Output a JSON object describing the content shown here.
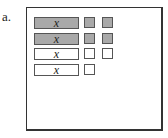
{
  "label": "a.",
  "colors": {
    "shaded": "#a9a9a9",
    "border": "#555555",
    "frame": "#333333"
  },
  "rows": [
    {
      "bar_text": "x",
      "shaded": true,
      "unit_squares": 2
    },
    {
      "bar_text": "x",
      "shaded": true,
      "unit_squares": 2
    },
    {
      "bar_text": "x",
      "shaded": false,
      "unit_squares": 2
    },
    {
      "bar_text": "x",
      "shaded": false,
      "unit_squares": 1
    }
  ]
}
